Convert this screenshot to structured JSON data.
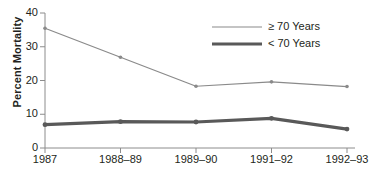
{
  "chart_data": {
    "type": "line",
    "title": "",
    "xlabel": "",
    "ylabel": "Percent Mortality",
    "categories": [
      "1987",
      "1988–89",
      "1989–90",
      "1991–92",
      "1992–93"
    ],
    "ylim": [
      0,
      40
    ],
    "yticks": [
      0,
      10,
      20,
      30,
      40
    ],
    "ytick_labels": [
      "0",
      "10",
      "20",
      "30",
      "40"
    ],
    "grid": false,
    "legend_position": "top-right",
    "series": [
      {
        "name": "≥ 70 Years",
        "values": [
          35.5,
          26.9,
          18.3,
          19.6,
          18.2
        ],
        "color": "#8a8a8a",
        "line_width": 1.2,
        "marker": "dot"
      },
      {
        "name": "< 70 Years",
        "values": [
          6.9,
          7.8,
          7.7,
          8.8,
          5.6
        ],
        "color": "#595959",
        "line_width": 3.2,
        "marker": "dot"
      }
    ]
  },
  "axes": {
    "axis_color": "#8c8c8c",
    "tick_color": "#8c8c8c"
  },
  "legend": {
    "items": [
      {
        "label": "≥ 70 Years"
      },
      {
        "label": "< 70 Years"
      }
    ]
  }
}
